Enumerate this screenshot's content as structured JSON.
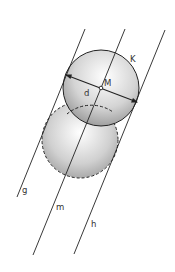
{
  "diagram": {
    "labels": {
      "circle": "K",
      "center": "M",
      "diameter": "d",
      "line_left": "g",
      "line_middle": "m",
      "line_right": "h"
    },
    "colors": {
      "stroke": "#222222",
      "sphere_light": "#ffffff",
      "sphere_dark": "#8a8a8a",
      "label": "#333333"
    }
  }
}
